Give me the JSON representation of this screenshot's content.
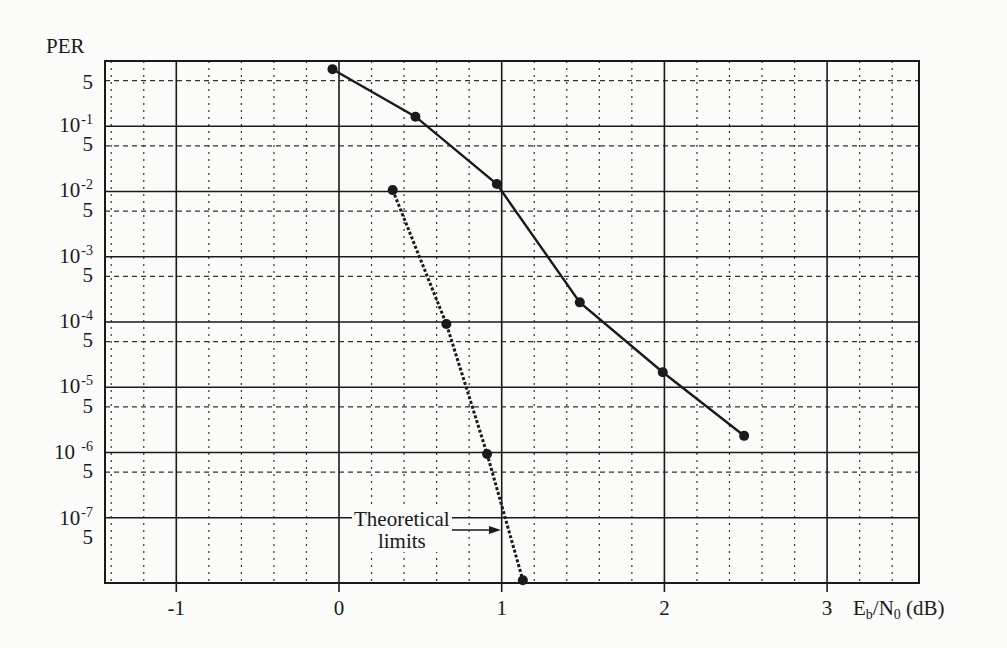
{
  "chart_data": {
    "type": "line",
    "title": "",
    "xlabel": "Eb/N0 (dB)",
    "ylabel": "PER",
    "xscale": "linear",
    "yscale": "log",
    "xlim": [
      -1.44,
      3.57
    ],
    "ylim": [
      1e-08,
      1.0
    ],
    "x_ticks": [
      -1,
      0,
      1,
      2,
      3
    ],
    "x_minor_step": 0.2,
    "y_major_ticks": [
      "10-1",
      "10-2",
      "10-3",
      "10-4",
      "10-5",
      "10 -6",
      "10-7"
    ],
    "y_minor_label": "5",
    "grid": {
      "major": "solid",
      "minor": "dashed"
    },
    "series": [
      {
        "name": "Simulated PER",
        "style": "solid",
        "marker": "circle",
        "x": [
          -0.04,
          0.47,
          0.97,
          1.48,
          1.99,
          2.49
        ],
        "y": [
          0.75,
          0.14,
          0.013,
          0.0002,
          1.7e-05,
          1.8e-06
        ]
      },
      {
        "name": "Theoretical limits",
        "style": "dotted",
        "marker": "circle",
        "x": [
          0.33,
          0.66,
          0.91,
          1.13
        ],
        "y": [
          0.0105,
          9.3e-05,
          9.5e-07,
          1.1e-08
        ]
      }
    ],
    "annotations": [
      {
        "text": "Theoretical limits",
        "arrow_to": {
          "x": 0.92,
          "y": 3e-08
        }
      }
    ]
  },
  "labels": {
    "y_title": "PER",
    "x_title_main": "E",
    "x_title_sub_b": "b",
    "x_title_mid": "/N",
    "x_title_sub_0": "0",
    "x_title_unit": " (dB)",
    "annotation_line1": "Theoretical",
    "annotation_line2": "limits",
    "y_ticks": [
      {
        "base": "5",
        "exp": "",
        "y": 82
      },
      {
        "base": "10",
        "exp": "-1",
        "y": 123
      },
      {
        "base": "5",
        "exp": "",
        "y": 144
      },
      {
        "base": "10",
        "exp": "-2",
        "y": 188
      },
      {
        "base": "5",
        "exp": "",
        "y": 210
      },
      {
        "base": "10",
        "exp": "-3",
        "y": 254
      },
      {
        "base": "5",
        "exp": "",
        "y": 275
      },
      {
        "base": "10",
        "exp": "-4",
        "y": 319
      },
      {
        "base": "5",
        "exp": "",
        "y": 340
      },
      {
        "base": "10",
        "exp": "-5",
        "y": 384
      },
      {
        "base": "5",
        "exp": "",
        "y": 406
      },
      {
        "base": "10 ",
        "exp": "-6",
        "y": 450
      },
      {
        "base": "5",
        "exp": "",
        "y": 471
      },
      {
        "base": "10",
        "exp": "-7",
        "y": 516
      },
      {
        "base": "5",
        "exp": "",
        "y": 537
      }
    ],
    "x_ticks": [
      "-1",
      "0",
      "1",
      "2",
      "3"
    ]
  },
  "colors": {
    "background": "#fbfbfa",
    "ink": "#1a1a1a",
    "grid": "#333333"
  }
}
